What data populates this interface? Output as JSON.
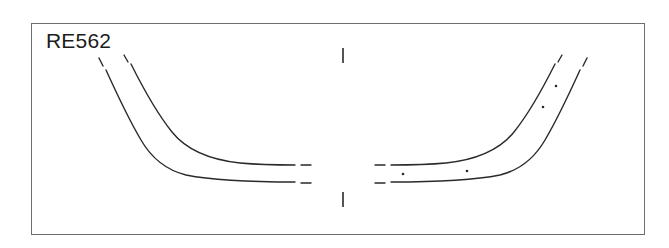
{
  "figure": {
    "specimen_label": "RE562",
    "frame": {
      "x": 31,
      "y": 23,
      "width": 614,
      "height": 212,
      "stroke_color": "#6e6e6e",
      "stroke_width": 1,
      "fill_color": "#ffffff"
    },
    "drawing": {
      "type": "vessel-profile-section",
      "ink_color": "#2a2a2a",
      "stroke_width": 1.4,
      "symmetry": "mirrored-about-vertical-axis",
      "axis_x": 343,
      "description": "Ceramic vessel profile drawing: two mirrored pairs of curved lines forming the flaring wall and base of an open bowl, with a central vertical axis marked by short tick marks above and below.",
      "center_axis_ticks": [
        {
          "name": "top-axis-tick",
          "x": 343,
          "y1": 48,
          "y2": 63
        },
        {
          "name": "bottom-axis-tick",
          "x": 343,
          "y1": 192,
          "y2": 207
        }
      ],
      "left_half": {
        "outer_curve": "M 106 70 C 116 92, 128 118, 141 140 C 152 159, 166 170, 186 175 C 216 181, 258 182, 295 182",
        "inner_curve": "M 131 64 C 142 86, 156 112, 172 132 C 188 152, 212 160, 240 163 C 262 165, 278 165, 295 165",
        "tick_outer_start": {
          "x1": 99,
          "y1": 58,
          "x2": 103,
          "y2": 66
        },
        "tick_inner_start": {
          "x1": 124,
          "y1": 55,
          "x2": 128,
          "y2": 62
        },
        "dash_outer_end": {
          "x1": 301,
          "y1": 183,
          "x2": 311,
          "y2": 183
        },
        "dash_inner_end": {
          "x1": 301,
          "y1": 165,
          "x2": 311,
          "y2": 165
        }
      },
      "right_half": {
        "outer_curve": "M 580 70 C 570 92, 558 118, 545 140 C 534 159, 520 170, 500 175 C 470 181, 428 182, 391 182",
        "inner_curve": "M 555 64 C 544 86, 530 112, 514 132 C 498 152, 474 160, 446 163 C 424 165, 408 165, 391 165",
        "tick_outer_start": {
          "x1": 587,
          "y1": 58,
          "x2": 583,
          "y2": 66
        },
        "tick_inner_start": {
          "x1": 562,
          "y1": 55,
          "x2": 558,
          "y2": 62
        },
        "dash_outer_end": {
          "x1": 385,
          "y1": 183,
          "x2": 375,
          "y2": 183
        },
        "dash_inner_end": {
          "x1": 385,
          "y1": 165,
          "x2": 375,
          "y2": 165
        }
      },
      "inclusion_dots": [
        {
          "name": "inclusion-dot-1",
          "cx": 403,
          "cy": 174,
          "r": 1.3
        },
        {
          "name": "inclusion-dot-2",
          "cx": 467,
          "cy": 171,
          "r": 1.3
        },
        {
          "name": "inclusion-dot-3",
          "cx": 543,
          "cy": 107,
          "r": 1.3
        },
        {
          "name": "inclusion-dot-4",
          "cx": 556,
          "cy": 86,
          "r": 1.3
        }
      ]
    }
  }
}
